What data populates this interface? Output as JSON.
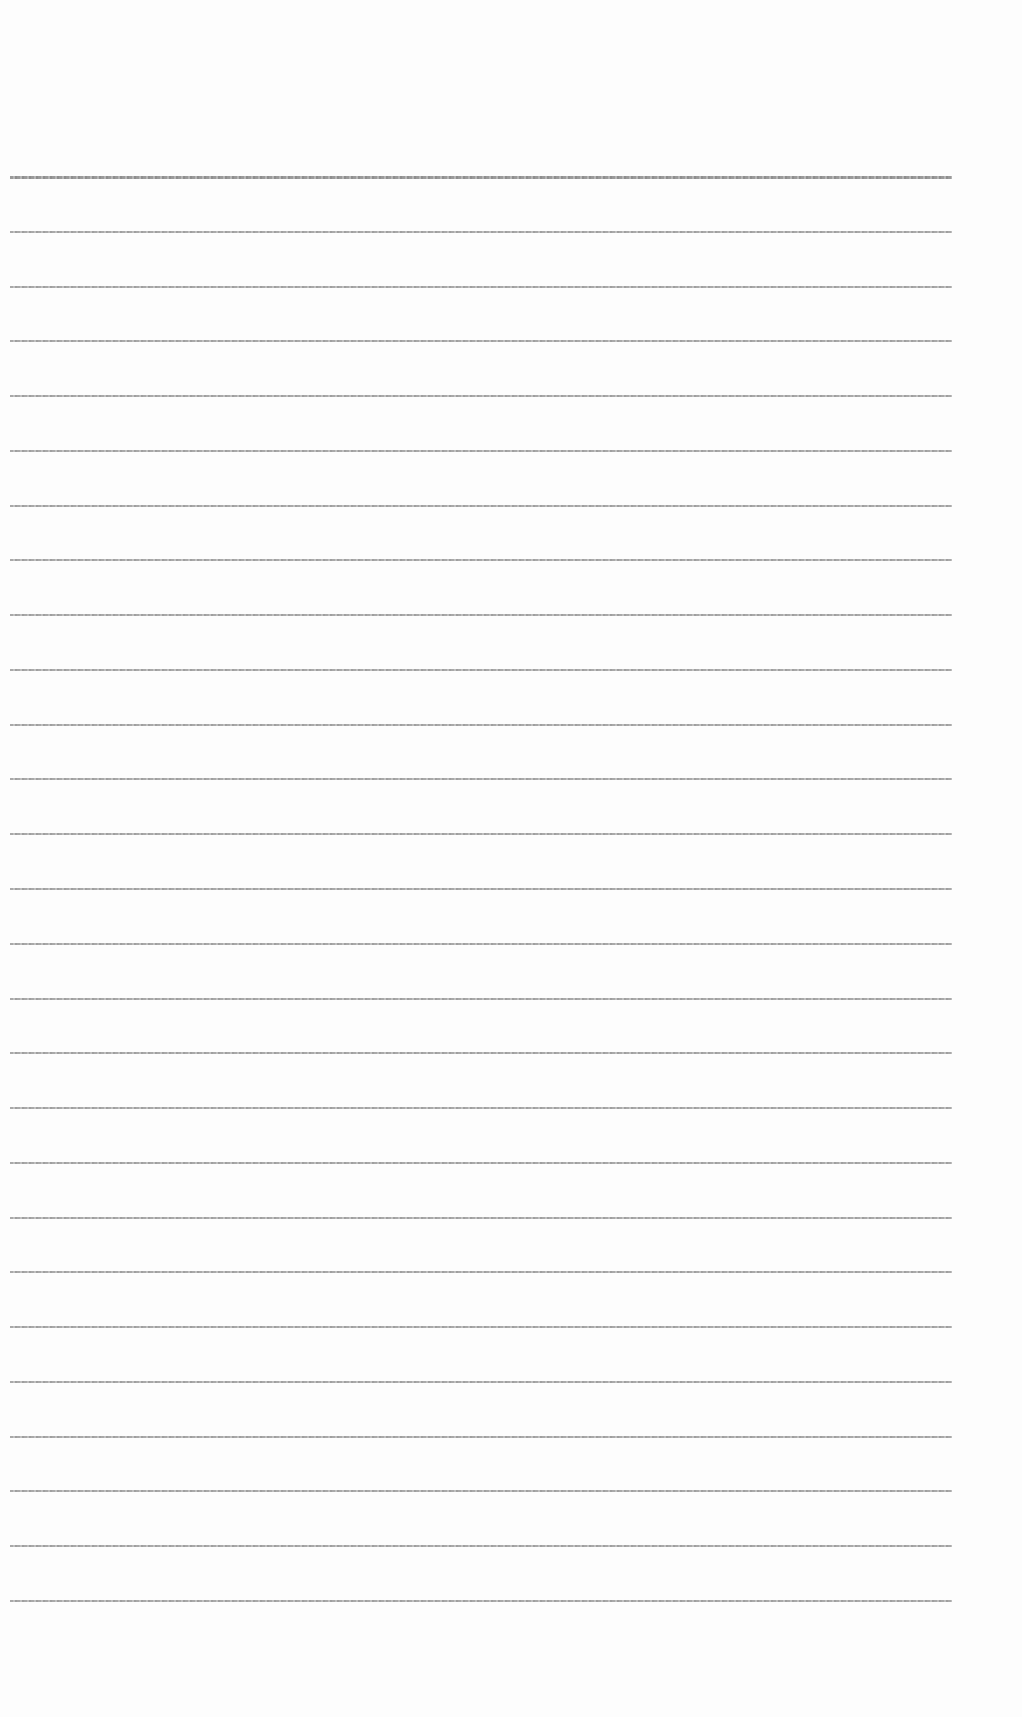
{
  "page": {
    "type": "lined-paper",
    "background_color": "#fdfdfd",
    "line_color": "#9a9a9a",
    "line_count": 27,
    "first_line_y": 176,
    "line_spacing": 54.77,
    "line_left_x": 10,
    "line_right_x": 952,
    "text": ""
  }
}
